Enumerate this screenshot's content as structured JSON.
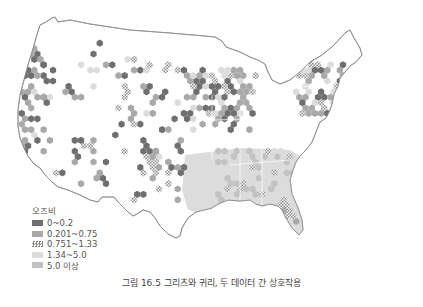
{
  "figure": {
    "caption": "그림 16.5 그리츠와 귀리, 두 데이터 간 상호작용"
  },
  "legend": {
    "title": "오즈비",
    "items": [
      {
        "label": "0~0.2",
        "color": "#6f6f6f",
        "pattern": "solid"
      },
      {
        "label": "0.201~0.75",
        "color": "#a9a9a9",
        "pattern": "solid"
      },
      {
        "label": "0.751~1.33",
        "color": "#9a9a9a",
        "pattern": "checker"
      },
      {
        "label": "1.34~5.0",
        "color": "#dcdcdc",
        "pattern": "solid"
      },
      {
        "label": "5.0 이상",
        "color": "#c2c2c2",
        "pattern": "solid"
      }
    ]
  },
  "map": {
    "region": "Contiguous United States",
    "outline_color": "#8a8a8a",
    "bins": {
      "west_coast": [
        "0~0.2",
        "0.201~0.75",
        "0~0.2",
        "0.201~0.75",
        "0~0.2",
        "0.201~0.75",
        "0.201~0.75",
        "0~0.2",
        "1.34~5.0",
        "0.201~0.75"
      ],
      "northwest_interior": [
        "0.201~0.75",
        "0~0.2",
        "0~0.2",
        "0.201~0.75",
        "0~0.2",
        "1.34~5.0"
      ],
      "southwest": [
        "0.201~0.75",
        "0~0.2",
        "0.751~1.33",
        "0~0.2",
        "0.201~0.75",
        "0~0.2"
      ],
      "plains": [
        "0~0.2",
        "0.201~0.75",
        "0.751~1.33",
        "0.201~0.75",
        "0~0.2",
        "1.34~5.0"
      ],
      "midwest": [
        "0.201~0.75",
        "0~0.2",
        "0.201~0.75",
        "0.751~1.33",
        "0.201~0.75",
        "1.34~5.0",
        "0~0.2"
      ],
      "northeast": [
        "0.201~0.75",
        "0.751~1.33",
        "0~0.2",
        "0.201~0.75",
        "1.34~5.0"
      ],
      "southeast": [
        "1.34~5.0",
        "5.0 이상",
        "0.751~1.33",
        "1.34~5.0",
        "5.0 이상"
      ],
      "texas": [
        "0.201~0.75",
        "0.751~1.33",
        "0~0.2",
        "0.201~0.75"
      ],
      "florida": [
        "1.34~5.0",
        "0.751~1.33",
        "0.201~0.75"
      ]
    }
  }
}
